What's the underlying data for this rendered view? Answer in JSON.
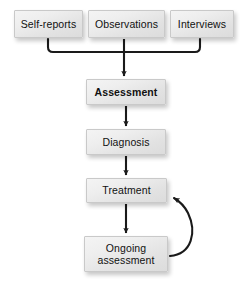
{
  "diagram": {
    "background_color": "#ffffff",
    "node_fill_top": "#f4f4f4",
    "node_fill_bottom": "#dcdcdc",
    "node_border_color": "#c9c9c9",
    "connector_color": "#1a1a1a",
    "nodes": [
      {
        "id": "self_reports",
        "label": "Self-reports",
        "bold": false
      },
      {
        "id": "observations",
        "label": "Observations",
        "bold": false
      },
      {
        "id": "interviews",
        "label": "Interviews",
        "bold": false
      },
      {
        "id": "assessment",
        "label": "Assessment",
        "bold": true
      },
      {
        "id": "diagnosis",
        "label": "Diagnosis",
        "bold": false
      },
      {
        "id": "treatment",
        "label": "Treatment",
        "bold": false
      },
      {
        "id": "ongoing_assessment",
        "label_line1": "Ongoing",
        "label_line2": "assessment",
        "bold": false
      }
    ],
    "connectors": [
      {
        "from": "self_reports",
        "to": "assessment",
        "style": "elbow-merge",
        "arrow": true
      },
      {
        "from": "observations",
        "to": "assessment",
        "style": "straight",
        "arrow": true
      },
      {
        "from": "interviews",
        "to": "assessment",
        "style": "elbow-merge",
        "arrow": true
      },
      {
        "from": "assessment",
        "to": "diagnosis",
        "style": "straight",
        "arrow": true
      },
      {
        "from": "diagnosis",
        "to": "treatment",
        "style": "straight",
        "arrow": true
      },
      {
        "from": "treatment",
        "to": "ongoing_assessment",
        "style": "straight",
        "arrow": true
      },
      {
        "from": "ongoing_assessment",
        "to": "treatment",
        "style": "curved-feedback",
        "arrow": true
      }
    ]
  }
}
